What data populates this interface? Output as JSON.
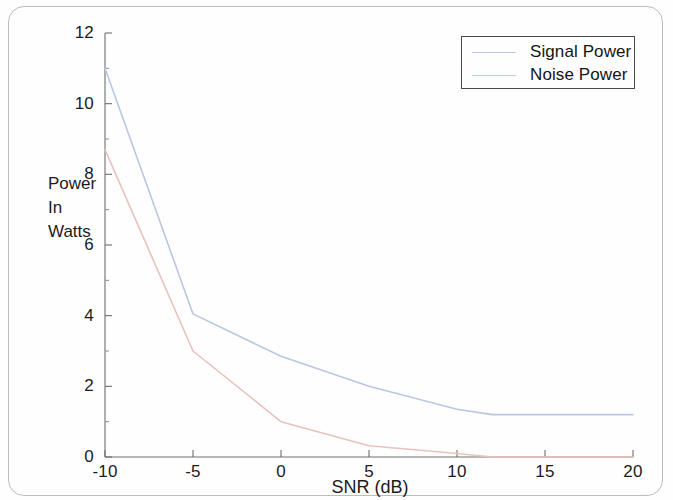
{
  "figure": {
    "background_color": "#fefefe",
    "axis_color": "#6e6e6e",
    "text_color": "#1b1b1b"
  },
  "axes": {
    "y_title_lines": [
      "Power",
      "In",
      "Watts"
    ],
    "x_title": "SNR (dB)",
    "y_ticks": [
      "0",
      "2",
      "4",
      "6",
      "8",
      "10",
      "12"
    ],
    "x_ticks": [
      "-10",
      "-5",
      "0",
      "5",
      "10",
      "15",
      "20"
    ]
  },
  "legend": {
    "entries": [
      {
        "label": "Signal Power",
        "color": "#b9c7e2"
      },
      {
        "label": "Noise Power",
        "color": "#e8c2bd"
      }
    ]
  },
  "chart_data": {
    "type": "line",
    "title": "",
    "subtitle": "",
    "xlabel": "SNR (dB)",
    "ylabel": "Power In Watts",
    "xlim": [
      -10,
      20
    ],
    "ylim": [
      0,
      12
    ],
    "xticks": [
      -10,
      -5,
      0,
      5,
      10,
      15,
      20
    ],
    "yticks": [
      0,
      2,
      4,
      6,
      8,
      10,
      12
    ],
    "grid": false,
    "legend_position": "top-right",
    "series": [
      {
        "name": "Signal Power",
        "color": "#b9c7e2",
        "x": [
          -10,
          -5,
          0,
          5,
          10,
          12,
          15,
          20
        ],
        "y": [
          11.0,
          4.05,
          2.85,
          2.0,
          1.35,
          1.2,
          1.2,
          1.2
        ]
      },
      {
        "name": "Noise Power",
        "color": "#e8c2bd",
        "x": [
          -10,
          -5,
          0,
          5,
          10,
          12,
          15,
          20
        ],
        "y": [
          8.7,
          3.0,
          1.0,
          0.32,
          0.1,
          0.0,
          0.0,
          0.0
        ]
      }
    ]
  }
}
